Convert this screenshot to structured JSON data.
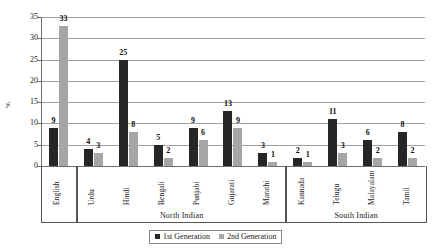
{
  "chart_data": {
    "type": "bar",
    "title": "",
    "xlabel": "",
    "ylabel": "%",
    "ylim": [
      0,
      35
    ],
    "yticks": [
      0,
      5,
      10,
      15,
      20,
      25,
      30,
      35
    ],
    "grid": true,
    "legend_position": "bottom",
    "categories": [
      "English",
      "Urdu",
      "Hindi",
      "Bengali",
      "Punjabi",
      "Gujarati",
      "Marathi",
      "Kannada",
      "Telugu",
      "Malayalam",
      "Tamil"
    ],
    "series": [
      {
        "name": "1st Generation",
        "color": "#262626",
        "values": [
          9,
          4,
          25,
          5,
          9,
          13,
          3,
          2,
          11,
          6,
          8
        ]
      },
      {
        "name": "2nd Generation",
        "color": "#a6a6a6",
        "values": [
          33,
          3,
          8,
          2,
          6,
          9,
          1,
          1,
          3,
          2,
          2
        ]
      }
    ],
    "groups": [
      {
        "label": "",
        "categories": [
          "English"
        ]
      },
      {
        "label": "North Indian",
        "categories": [
          "Urdu",
          "Hindi",
          "Bengali",
          "Punjabi",
          "Gujarati",
          "Marathi"
        ]
      },
      {
        "label": "South Indian",
        "categories": [
          "Kannada",
          "Telugu",
          "Malayalam",
          "Tamil"
        ]
      }
    ]
  },
  "legend": {
    "items": [
      {
        "label": "1st Generation"
      },
      {
        "label": "2nd Generation"
      }
    ]
  }
}
